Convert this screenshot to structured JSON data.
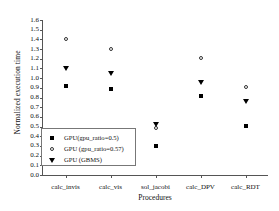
{
  "chart_data": {
    "type": "scatter",
    "title": "",
    "xlabel": "Procedures",
    "ylabel": "Normalized execution time",
    "ylim": [
      0.0,
      1.6
    ],
    "ytick_step": 0.1,
    "grid": false,
    "legend_position": "lower-left-inside",
    "categories": [
      "calc_invis",
      "calc_vis",
      "sol_jacobi",
      "calc_DPV",
      "calc_RDT"
    ],
    "yticks": [
      "0.0",
      "0.1",
      "0.2",
      "0.3",
      "0.4",
      "0.5",
      "0.6",
      "0.7",
      "0.8",
      "0.9",
      "1.0",
      "1.1",
      "1.2",
      "1.3",
      "1.4",
      "1.5",
      "1.6"
    ],
    "series": [
      {
        "name": "GPU(gpu_ratio=0.5)",
        "marker": "square-filled",
        "color": "#000000",
        "values": [
          0.92,
          0.89,
          0.3,
          0.82,
          0.51
        ]
      },
      {
        "name": "GPU (gpu_ratio=0.57)",
        "marker": "circle-open",
        "color": "#333333",
        "values": [
          1.4,
          1.3,
          0.49,
          1.21,
          0.91
        ]
      },
      {
        "name": "GPU (GBMS)",
        "marker": "triangle-down-filled",
        "color": "#000000",
        "values": [
          1.1,
          1.05,
          0.52,
          0.95,
          0.76
        ]
      }
    ]
  }
}
